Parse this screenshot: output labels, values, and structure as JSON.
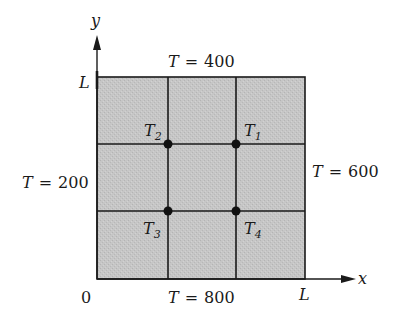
{
  "diagram": {
    "type": "heat-conduction-grid",
    "colors": {
      "fill": "#c4c4c4",
      "line": "#1a1a1a",
      "background": "#ffffff"
    },
    "axes": {
      "x_label": "x",
      "y_label": "y",
      "origin_label": "0",
      "x_end_label": "L",
      "y_end_label": "L"
    },
    "boundaries": {
      "top": {
        "var": "T",
        "eq": "=",
        "value": "400"
      },
      "bottom": {
        "var": "T",
        "eq": "=",
        "value": "800"
      },
      "left": {
        "var": "T",
        "eq": "=",
        "value": "200"
      },
      "right": {
        "var": "T",
        "eq": "=",
        "value": "600"
      }
    },
    "nodes": [
      {
        "var": "T",
        "sub": "1",
        "position": "upper-right"
      },
      {
        "var": "T",
        "sub": "2",
        "position": "upper-left"
      },
      {
        "var": "T",
        "sub": "3",
        "position": "lower-left"
      },
      {
        "var": "T",
        "sub": "4",
        "position": "lower-right"
      }
    ],
    "grid": {
      "rows": 3,
      "cols": 3
    }
  }
}
